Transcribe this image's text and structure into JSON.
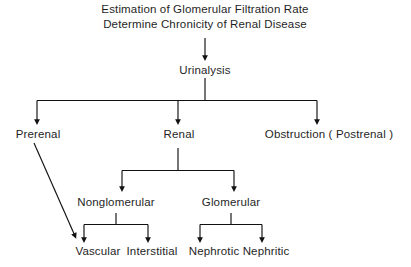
{
  "diagram": {
    "title_lines": [
      "Estimation of Glomerular Filtration Rate",
      "Determine Chronicity of Renal Disease"
    ],
    "nodes": {
      "urinalysis": "Urinalysis",
      "prerenal": "Prerenal",
      "renal": "Renal",
      "obstruction": "Obstruction ( Postrenal )",
      "nonglomerular": "Nonglomerular",
      "glomerular": "Glomerular",
      "vascular": "Vascular",
      "interstitial": "Interstitial",
      "nephrotic": "Nephrotic",
      "nephritic": "Nephritic"
    },
    "colors": {
      "background": "#ffffff",
      "text": "#1f1f1f",
      "line": "#111111"
    }
  }
}
